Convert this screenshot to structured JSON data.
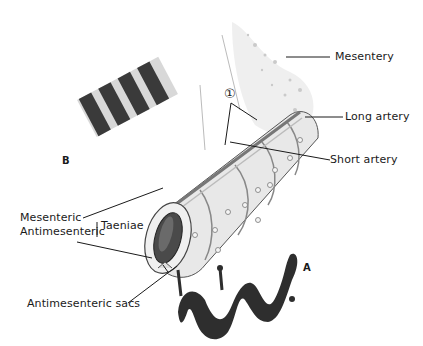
{
  "figure": {
    "labels": {
      "mesentery": "Mesentery",
      "long_artery": "Long artery",
      "short_artery": "Short artery",
      "marker_1": "①",
      "mesenteric": "Mesenteric",
      "antimesenteric": "Antimesenteric",
      "taeniae": "Taeniae",
      "antimesenteric_sacs": "Antimesenteric sacs",
      "panel_a": "A",
      "panel_b": "B"
    },
    "colors": {
      "ink": "#1a1a1a",
      "band_dark": "#3a3a3a",
      "band_light": "#d8d8d8",
      "wall": "#e6e6e6",
      "shade": "#9a9a9a"
    }
  }
}
